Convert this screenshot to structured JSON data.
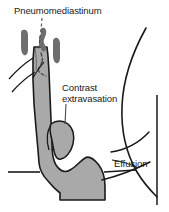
{
  "figure": {
    "title": "Pneumomediastinum",
    "kind": "medical-illustration",
    "background_color": "#ffffff",
    "outline_color": "#1a1a1a",
    "esophagus_fill": "#a9a9a9",
    "mediastinal_air_fill": "#6e6e6e",
    "extravasation_fill": "#a9a9a9",
    "text_color": "#1a1a1a"
  },
  "labels": {
    "pneumomediastinum": "Pneumomediastinum",
    "contrast_line1": "Contrast",
    "contrast_line2": "extravasation",
    "effusion": "Effusion"
  },
  "structures": {
    "esophagus": "esophagus-shape",
    "stomach": "gastric-fundus-shape",
    "mediastinal_air_streaks": [
      "air-streak-left",
      "air-streak-center-upper",
      "air-streak-center-lower",
      "air-streak-right"
    ],
    "extravasation_blob": "contrast-extravasation-blob",
    "chest_wall": "chest-wall-outline",
    "diaphragm": "diaphragm-line",
    "effusion_meniscus": "effusion-meniscus-curve",
    "clavicle_lines": [
      "clavicle-line-upper",
      "clavicle-line-lower"
    ],
    "tracheal_dashes": [
      "tracheal-dash-upper",
      "tracheal-dash-lower"
    ]
  },
  "leaders": {
    "pneumomediastinum_leader": "leader-line-pneumomediastinum",
    "contrast_leader": "leader-line-contrast",
    "effusion_leader": "leader-line-effusion"
  }
}
